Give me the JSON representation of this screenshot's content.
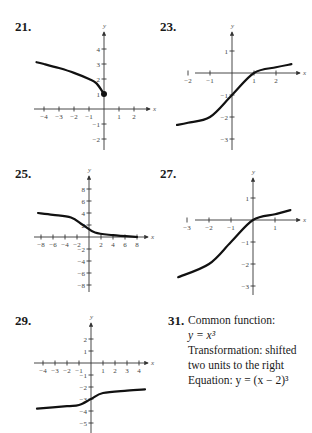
{
  "exercises": [
    {
      "number": "21.",
      "type": "graph"
    },
    {
      "number": "23.",
      "type": "graph"
    },
    {
      "number": "25.",
      "type": "graph"
    },
    {
      "number": "27.",
      "type": "graph"
    },
    {
      "number": "29.",
      "type": "graph"
    },
    {
      "number": "31.",
      "type": "text",
      "line1": "Common function:",
      "line2": "y = x³",
      "line3": "Transformation:  shifted",
      "line4": "two units to the right",
      "line5": "Equation:  y = (x − 2)³"
    }
  ],
  "chart_data": [
    {
      "type": "line",
      "id": "21",
      "title": "21.",
      "xlabel": "x",
      "ylabel": "y",
      "xticks": [
        -4,
        -3,
        -2,
        -1,
        1,
        2
      ],
      "yticks": [
        -2,
        -1,
        1,
        2,
        3,
        4
      ],
      "xlim": [
        -4.5,
        2.8
      ],
      "ylim": [
        -2.5,
        5
      ],
      "description": "y = sqrt(-x) + 1, endpoint (0,1) filled",
      "points": [
        [
          -4.5,
          3.12
        ],
        [
          -4,
          3
        ],
        [
          -3,
          2.73
        ],
        [
          -2,
          2.41
        ],
        [
          -1,
          2
        ],
        [
          -0.5,
          1.71
        ],
        [
          0,
          1
        ]
      ]
    },
    {
      "type": "line",
      "id": "23",
      "title": "23.",
      "xlabel": "x",
      "ylabel": "y",
      "xticks": [
        -2,
        -1,
        1,
        2
      ],
      "yticks": [
        -3,
        -2,
        -1,
        1
      ],
      "xlim": [
        -2.5,
        2.8
      ],
      "ylim": [
        -3.5,
        1.8
      ],
      "description": "cube-root type curve, inflection near (0,-1)",
      "points": [
        [
          -2.5,
          -2.36
        ],
        [
          -2,
          -2.26
        ],
        [
          -1,
          -2
        ],
        [
          0,
          -1
        ],
        [
          1,
          0
        ],
        [
          2,
          0.26
        ],
        [
          2.7,
          0.4
        ]
      ]
    },
    {
      "type": "line",
      "id": "25",
      "title": "25.",
      "xlabel": "x",
      "ylabel": "y",
      "xticks": [
        -8,
        -6,
        -4,
        -2,
        2,
        4,
        6,
        8
      ],
      "yticks": [
        -8,
        -6,
        -4,
        -2,
        2,
        4,
        6,
        8
      ],
      "xlim": [
        -9,
        9.5
      ],
      "ylim": [
        -9,
        10
      ],
      "description": "decreasing cube-root type curve, inflection near (-1,2)",
      "points": [
        [
          -8.5,
          4
        ],
        [
          -6,
          3.7
        ],
        [
          -3,
          3.26
        ],
        [
          -1,
          2
        ],
        [
          1,
          0.74
        ],
        [
          4,
          0.3
        ],
        [
          8,
          0
        ]
      ]
    },
    {
      "type": "line",
      "id": "27",
      "title": "27.",
      "xlabel": "x",
      "ylabel": "y",
      "xticks": [
        -3,
        -2,
        -1,
        1
      ],
      "yticks": [
        -3,
        -2,
        -1,
        1
      ],
      "xlim": [
        -3.4,
        1.8
      ],
      "ylim": [
        -3.5,
        1.9
      ],
      "description": "cube-root type curve, inflection near (-1,-1)",
      "points": [
        [
          -3.4,
          -2.6
        ],
        [
          -2,
          -2
        ],
        [
          -1,
          -1
        ],
        [
          0,
          0
        ],
        [
          1,
          0.26
        ],
        [
          1.7,
          0.45
        ]
      ]
    },
    {
      "type": "line",
      "id": "29",
      "title": "29.",
      "xlabel": "x",
      "ylabel": "y",
      "xticks": [
        -4,
        -3,
        -2,
        -1,
        1,
        2,
        3,
        4
      ],
      "yticks": [
        -5,
        -4,
        -3,
        -2,
        -1,
        1,
        2
      ],
      "xlim": [
        -4.5,
        4.7
      ],
      "ylim": [
        -5.5,
        3
      ],
      "description": "cube-root type curve, inflection near (0,-3)",
      "points": [
        [
          -4.5,
          -3.8
        ],
        [
          -2,
          -3.6
        ],
        [
          -1,
          -3.5
        ],
        [
          0,
          -3
        ],
        [
          1,
          -2.5
        ],
        [
          3,
          -2.3
        ],
        [
          4.5,
          -2.2
        ]
      ]
    }
  ]
}
